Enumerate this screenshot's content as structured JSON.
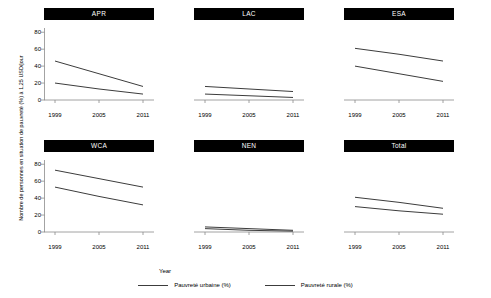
{
  "chart_data": {
    "type": "line",
    "title": "",
    "xlabel": "Year",
    "ylabel": "Nombre de personnes en situation de pauvreté (%) à 1,25 USD/jour",
    "x": [
      1999,
      2005,
      2011
    ],
    "xticklabels": [
      "1999",
      "2005",
      "2011"
    ],
    "yticklabels": [
      "0",
      "20",
      "40",
      "60",
      "80"
    ],
    "yticks": [
      0,
      20,
      40,
      60,
      80
    ],
    "ylim": [
      0,
      85
    ],
    "xlim": [
      1999,
      2011
    ],
    "grid": false,
    "legend_position": "bottom",
    "series_names": [
      "Pauvreté urbaine (%)",
      "Pauvreté rurale (%)"
    ],
    "line_color": "#3c3c3c",
    "strip_background": "#000000",
    "strip_text_color": "#ffffff",
    "panels": [
      {
        "name": "APR",
        "series": [
          {
            "name": "Pauvreté urbaine (%)",
            "values": [
              20,
              13,
              7
            ]
          },
          {
            "name": "Pauvreté rurale (%)",
            "values": [
              46,
              31,
              16
            ]
          }
        ]
      },
      {
        "name": "LAC",
        "series": [
          {
            "name": "Pauvreté urbaine (%)",
            "values": [
              7,
              5,
              3
            ]
          },
          {
            "name": "Pauvreté rurale (%)",
            "values": [
              16,
              13,
              10
            ]
          }
        ]
      },
      {
        "name": "ESA",
        "series": [
          {
            "name": "Pauvreté urbaine (%)",
            "values": [
              40,
              31,
              22
            ]
          },
          {
            "name": "Pauvreté rurale (%)",
            "values": [
              61,
              54,
              46
            ]
          }
        ]
      },
      {
        "name": "WCA",
        "series": [
          {
            "name": "Pauvreté urbaine (%)",
            "values": [
              53,
              42,
              32
            ]
          },
          {
            "name": "Pauvreté rurale (%)",
            "values": [
              73,
              63,
              53
            ]
          }
        ]
      },
      {
        "name": "NEN",
        "series": [
          {
            "name": "Pauvreté urbaine (%)",
            "values": [
              4,
              2,
              1
            ]
          },
          {
            "name": "Pauvreté rurale (%)",
            "values": [
              6,
              4,
              2
            ]
          }
        ]
      },
      {
        "name": "Total",
        "series": [
          {
            "name": "Pauvreté urbaine (%)",
            "values": [
              30,
              25,
              21
            ]
          },
          {
            "name": "Pauvreté rurale (%)",
            "values": [
              41,
              35,
              28
            ]
          }
        ]
      }
    ]
  },
  "legend": {
    "items": [
      {
        "label": "Pauvreté urbaine (%)"
      },
      {
        "label": "Pauvreté rurale (%)"
      }
    ]
  },
  "axes": {
    "xlabel": "Year",
    "ylabel": "Nombre de personnes en situation de pauvreté (%) à 1,25 USD/jour"
  }
}
